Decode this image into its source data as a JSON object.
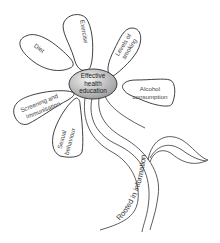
{
  "diagram": {
    "center": {
      "lines": [
        "Effective",
        "health",
        "education"
      ],
      "fill_light": "#f2f2f2",
      "fill_dark": "#9a9a9a"
    },
    "petals": [
      {
        "id": "diet",
        "lines": [
          "Diet"
        ]
      },
      {
        "id": "exercise",
        "lines": [
          "Exercise"
        ]
      },
      {
        "id": "levels-of-smoking",
        "lines": [
          "Levels of",
          "smoking"
        ]
      },
      {
        "id": "alcohol-consumption",
        "lines": [
          "Alcohol",
          "consumption"
        ]
      },
      {
        "id": "screening-and-immunisation",
        "lines": [
          "Screening and",
          "immunisation"
        ]
      },
      {
        "id": "sexual-behaviour",
        "lines": [
          "Sexual",
          "behaviour"
        ]
      }
    ],
    "stem": {
      "label": "Rooted in information"
    },
    "colors": {
      "outline": "#2a2a2a",
      "text": "#444444",
      "background": "#ffffff"
    }
  }
}
